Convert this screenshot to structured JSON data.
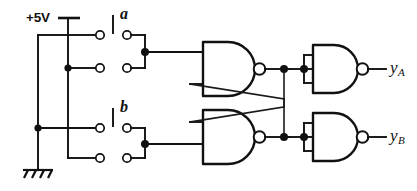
{
  "figure": {
    "kind": "schematic-diagram",
    "width": 417,
    "height": 191,
    "background_color": "#ffffff",
    "ink_color": "#111111"
  },
  "labels": {
    "supply": "+5V",
    "switch_a": "a",
    "switch_b": "b",
    "output_a_base": "y",
    "output_a_sub": "A",
    "output_b_base": "y",
    "output_b_sub": "B"
  },
  "nodes": {
    "supply_rail": "+5V",
    "ground_symbol": "earth-ground",
    "switch_a_type": "SPDT-momentary",
    "switch_b_type": "SPDT-momentary",
    "latch_gate_top": "NAND",
    "latch_gate_bottom": "NAND",
    "buffer_gate_top": "NAND-as-inverter",
    "buffer_gate_bottom": "NAND-as-inverter"
  },
  "circuit": {
    "components": [
      {
        "id": "supply",
        "label": "+5V",
        "type": "power-terminal"
      },
      {
        "id": "ground",
        "label": "",
        "type": "ground-terminal"
      },
      {
        "id": "sw-a",
        "label": "a",
        "type": "spdt-switch"
      },
      {
        "id": "sw-b",
        "label": "b",
        "type": "spdt-switch"
      },
      {
        "id": "nand-top",
        "label": "",
        "type": "nand-gate"
      },
      {
        "id": "nand-bottom",
        "label": "",
        "type": "nand-gate"
      },
      {
        "id": "inv-top",
        "label": "",
        "type": "nand-inverter"
      },
      {
        "id": "inv-bottom",
        "label": "",
        "type": "nand-inverter"
      }
    ],
    "outputs": [
      {
        "id": "y-a",
        "label": "yA"
      },
      {
        "id": "y-b",
        "label": "yB"
      }
    ]
  }
}
